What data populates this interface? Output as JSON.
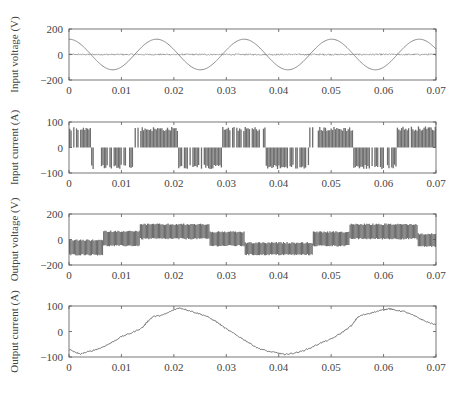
{
  "figure": {
    "x_ticks": [
      "0",
      "0.01",
      "0.02",
      "0.03",
      "0.04",
      "0.05",
      "0.06",
      "0.07"
    ],
    "x_range": [
      0,
      0.07
    ]
  },
  "chart_data": [
    {
      "type": "line",
      "title": "",
      "xlabel": "",
      "ylabel": "Input voltage (V)",
      "ylim": [
        -200,
        200
      ],
      "y_ticks": [
        "200",
        "0",
        "-200"
      ],
      "y_tick_values": [
        200,
        0,
        -200
      ],
      "x_ticks": [
        0,
        0.01,
        0.02,
        0.03,
        0.04,
        0.05,
        0.06,
        0.07
      ],
      "grid": false,
      "series": [
        {
          "name": "input voltage",
          "kind": "sine",
          "amplitude": 120,
          "period": 0.0167,
          "phase_peak_at": 0.0,
          "color": "#8a8a8a"
        },
        {
          "name": "switching noise band",
          "kind": "noise_band",
          "center": 0,
          "spread": 6,
          "color": "#777777"
        }
      ]
    },
    {
      "type": "line",
      "title": "",
      "xlabel": "",
      "ylabel": "Input current (A)",
      "ylim": [
        -100,
        100
      ],
      "y_ticks": [
        "100",
        "0",
        "-100"
      ],
      "y_tick_values": [
        100,
        0,
        -100
      ],
      "x_ticks": [
        0,
        0.01,
        0.02,
        0.03,
        0.04,
        0.05,
        0.06,
        0.07
      ],
      "grid": false,
      "series": [
        {
          "name": "input current",
          "kind": "pwm_blocks",
          "color": "#555555",
          "segments": [
            {
              "t0": 0.0,
              "t1": 0.0042,
              "level": 80
            },
            {
              "t0": 0.0042,
              "t1": 0.0125,
              "level": -82
            },
            {
              "t0": 0.0125,
              "t1": 0.0208,
              "level": 78
            },
            {
              "t0": 0.0208,
              "t1": 0.0292,
              "level": -82
            },
            {
              "t0": 0.0292,
              "t1": 0.0375,
              "level": 78
            },
            {
              "t0": 0.0375,
              "t1": 0.0458,
              "level": -82
            },
            {
              "t0": 0.0458,
              "t1": 0.0542,
              "level": 78
            },
            {
              "t0": 0.0542,
              "t1": 0.0625,
              "level": -82
            },
            {
              "t0": 0.0625,
              "t1": 0.07,
              "level": 80
            }
          ]
        }
      ]
    },
    {
      "type": "line",
      "title": "",
      "xlabel": "",
      "ylabel": "Output voltage (V)",
      "ylim": [
        -200,
        200
      ],
      "y_ticks": [
        "200",
        "0",
        "-200"
      ],
      "y_tick_values": [
        200,
        0,
        -200
      ],
      "x_ticks": [
        0,
        0.01,
        0.02,
        0.03,
        0.04,
        0.05,
        0.06,
        0.07
      ],
      "grid": false,
      "series": [
        {
          "name": "output voltage",
          "kind": "pwm_band",
          "color": "#555555",
          "segments": [
            {
              "t0": 0.0,
              "t1": 0.0065,
              "lo": -125,
              "hi": 0
            },
            {
              "t0": 0.0065,
              "t1": 0.0135,
              "lo": -55,
              "hi": 70
            },
            {
              "t0": 0.0135,
              "t1": 0.0268,
              "lo": 0,
              "hi": 125
            },
            {
              "t0": 0.0268,
              "t1": 0.0335,
              "lo": -55,
              "hi": 65
            },
            {
              "t0": 0.0335,
              "t1": 0.0465,
              "lo": -125,
              "hi": -20
            },
            {
              "t0": 0.0465,
              "t1": 0.0535,
              "lo": -55,
              "hi": 65
            },
            {
              "t0": 0.0535,
              "t1": 0.0665,
              "lo": 0,
              "hi": 125
            },
            {
              "t0": 0.0665,
              "t1": 0.07,
              "lo": -60,
              "hi": 50
            }
          ]
        }
      ]
    },
    {
      "type": "line",
      "title": "",
      "xlabel": "",
      "ylabel": "Output current (A)",
      "ylim": [
        -100,
        100
      ],
      "y_ticks": [
        "100",
        "0",
        "-100"
      ],
      "y_tick_values": [
        100,
        0,
        -100
      ],
      "x_ticks": [
        0,
        0.01,
        0.02,
        0.03,
        0.04,
        0.05,
        0.06,
        0.07
      ],
      "grid": false,
      "series": [
        {
          "name": "output current",
          "kind": "points",
          "color": "#666666",
          "x": [
            0,
            0.001,
            0.002,
            0.004,
            0.006,
            0.008,
            0.01,
            0.012,
            0.014,
            0.015,
            0.016,
            0.018,
            0.02,
            0.021,
            0.022,
            0.024,
            0.026,
            0.028,
            0.03,
            0.032,
            0.034,
            0.036,
            0.038,
            0.04,
            0.041,
            0.042,
            0.044,
            0.046,
            0.048,
            0.05,
            0.052,
            0.054,
            0.055,
            0.056,
            0.058,
            0.06,
            0.061,
            0.062,
            0.064,
            0.066,
            0.068,
            0.07
          ],
          "y": [
            -70,
            -80,
            -88,
            -78,
            -65,
            -45,
            -20,
            -5,
            15,
            40,
            58,
            65,
            85,
            92,
            88,
            75,
            62,
            40,
            10,
            -15,
            -40,
            -65,
            -78,
            -85,
            -90,
            -88,
            -80,
            -65,
            -45,
            -30,
            -5,
            25,
            55,
            65,
            75,
            85,
            90,
            85,
            78,
            60,
            40,
            25
          ]
        }
      ]
    }
  ]
}
